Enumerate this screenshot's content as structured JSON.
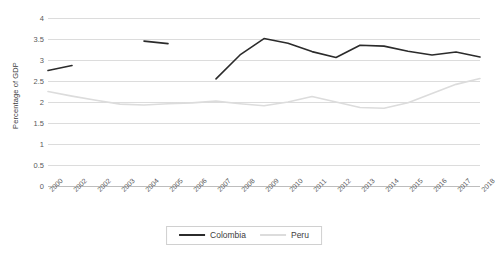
{
  "chart_data": {
    "type": "line",
    "title": "",
    "xlabel": "",
    "ylabel": "Percentage of GDP",
    "ylim": [
      0,
      4
    ],
    "ytick_step": 0.5,
    "yticks": [
      4,
      3.5,
      3,
      2.5,
      2,
      1.5,
      1,
      0.5,
      0
    ],
    "ytick_labels": [
      "4",
      "3.5",
      "3",
      "2.5",
      "2",
      "1.5",
      "1",
      "0.5",
      "0"
    ],
    "grid": true,
    "grid_axis": "y",
    "legend_position": "bottom",
    "categories": [
      "2000",
      "2002",
      "2002",
      "2003",
      "2004",
      "2005",
      "2006",
      "2007",
      "2008",
      "2009",
      "2010",
      "2011",
      "2012",
      "2013",
      "2014",
      "2015",
      "2016",
      "2017",
      "2018"
    ],
    "series": [
      {
        "name": "Colombia",
        "color": "#2b2b2b",
        "values": [
          2.75,
          2.87,
          null,
          null,
          3.45,
          3.39,
          null,
          2.55,
          3.12,
          3.51,
          3.4,
          3.2,
          3.06,
          3.35,
          3.33,
          3.21,
          3.12,
          3.19,
          3.07
        ]
      },
      {
        "name": "Peru",
        "color": "#dcdcdc",
        "values": [
          2.25,
          2.14,
          2.04,
          1.95,
          1.93,
          1.96,
          1.98,
          2.02,
          1.96,
          1.91,
          2.0,
          2.13,
          2.0,
          1.87,
          1.85,
          1.98,
          2.2,
          2.42,
          2.56
        ]
      }
    ],
    "series_extra": {
      "peru_tail": [
        2.58,
        2.62,
        2.55,
        2.6,
        2.54
      ]
    }
  },
  "legend": {
    "items": [
      {
        "label": "Colombia",
        "color": "#2b2b2b"
      },
      {
        "label": "Peru",
        "color": "#dcdcdc"
      }
    ]
  },
  "axes": {
    "y_title": "Percentage of GDP"
  }
}
